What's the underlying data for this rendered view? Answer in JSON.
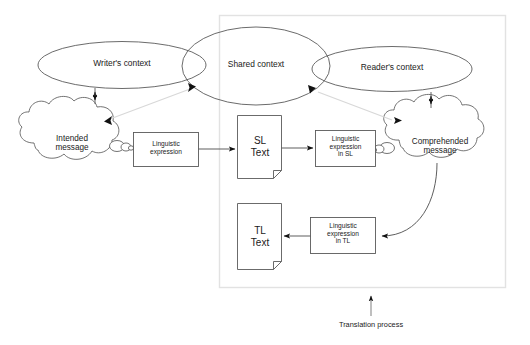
{
  "diagram": {
    "caption": "Translation process",
    "colors": {
      "stroke": "#5a5a5a",
      "faint_stroke": "#d8d8d8",
      "frame": "#e2e2e2",
      "text": "#1a1a1a",
      "arrow_fill": "#111111",
      "background": "#ffffff"
    },
    "contexts": [
      {
        "id": "writer-context",
        "label": "Writer's context"
      },
      {
        "id": "shared-context",
        "label": "Shared context"
      },
      {
        "id": "reader-context",
        "label": "Reader's context"
      }
    ],
    "clouds": [
      {
        "id": "intended-message",
        "label": "Intended\nmessage"
      },
      {
        "id": "comprehended-message",
        "label": "Comprehended\nmessage"
      }
    ],
    "boxes": [
      {
        "id": "linguistic-expression",
        "label": "Linguistic\nexpression"
      },
      {
        "id": "linguistic-expression-sl",
        "label": "Linguistic\nexpression\nin SL"
      },
      {
        "id": "linguistic-expression-tl",
        "label": "Linguistic\nexpression\nin TL"
      }
    ],
    "documents": [
      {
        "id": "sl-text",
        "label": "SL\nText"
      },
      {
        "id": "tl-text",
        "label": "TL\nText"
      }
    ]
  }
}
